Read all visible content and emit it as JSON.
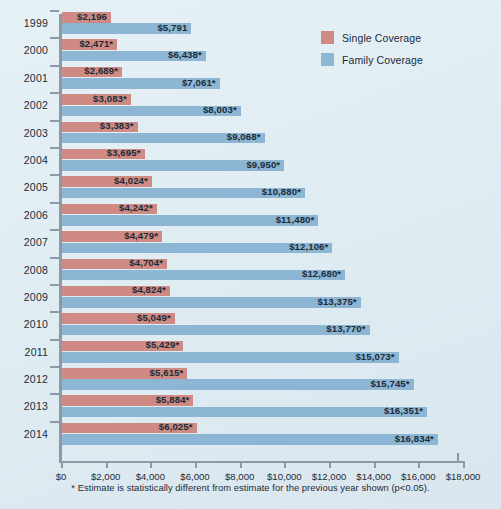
{
  "chart_data": {
    "type": "bar",
    "orientation": "horizontal",
    "title": "",
    "xlabel": "",
    "ylabel": "",
    "xlim": [
      0,
      18000
    ],
    "xticks": [
      0,
      2000,
      4000,
      6000,
      8000,
      10000,
      12000,
      14000,
      16000,
      18000
    ],
    "xtick_labels": [
      "$0",
      "$2,000",
      "$4,000",
      "$6,000",
      "$8,000",
      "$10,000",
      "$12,000",
      "$14,000",
      "$16,000",
      "$18,000"
    ],
    "grid": false,
    "legend_position": "top-right",
    "categories": [
      "1999",
      "2000",
      "2001",
      "2002",
      "2003",
      "2004",
      "2005",
      "2006",
      "2007",
      "2008",
      "2009",
      "2010",
      "2011",
      "2012",
      "2013",
      "2014"
    ],
    "series": [
      {
        "name": "Single Coverage",
        "color": "#d08a84",
        "values": [
          2196,
          2471,
          2689,
          3083,
          3383,
          3695,
          4024,
          4242,
          4479,
          4704,
          4824,
          5049,
          5429,
          5615,
          5884,
          6025
        ],
        "labels": [
          "$2,196",
          "$2,471*",
          "$2,689*",
          "$3,083*",
          "$3,383*",
          "$3,695*",
          "$4,024*",
          "$4,242*",
          "$4,479*",
          "$4,704*",
          "$4,824*",
          "$5,049*",
          "$5,429*",
          "$5,615*",
          "$5,884*",
          "$6,025*"
        ]
      },
      {
        "name": "Family Coverage",
        "color": "#8cb6d4",
        "values": [
          5791,
          6438,
          7061,
          8003,
          9068,
          9950,
          10880,
          11480,
          12106,
          12680,
          13375,
          13770,
          15073,
          15745,
          16351,
          16834
        ],
        "labels": [
          "$5,791",
          "$6,438*",
          "$7,061*",
          "$8,003*",
          "$9,068*",
          "$9,950*",
          "$10,880*",
          "$11,480*",
          "$12,106*",
          "$12,680*",
          "$13,375*",
          "$13,770*",
          "$15,073*",
          "$15,745*",
          "$16,351*",
          "$16,834*"
        ]
      }
    ],
    "annotations": [
      "* Estimate is statistically different from estimate for the previous year shown (p<0.05)."
    ]
  },
  "legend": {
    "items": [
      {
        "label": "Single Coverage",
        "color": "#d08a84"
      },
      {
        "label": "Family Coverage",
        "color": "#8cb6d4"
      }
    ]
  },
  "footnote": "* Estimate is statistically different from estimate for the previous year shown (p<0.05).",
  "colors": {
    "background": "#e2eef4",
    "axis": "#8d9aa3",
    "text": "#1b2b38",
    "single": "#d08a84",
    "family": "#8cb6d4"
  }
}
